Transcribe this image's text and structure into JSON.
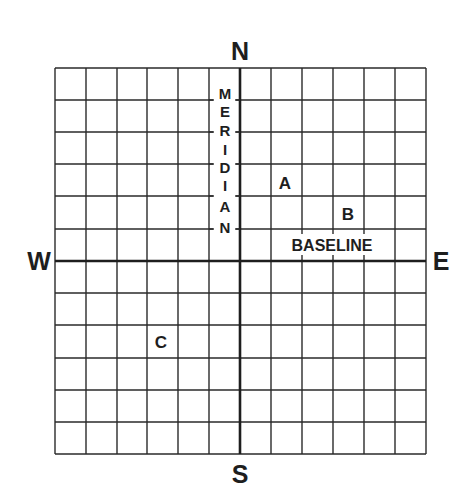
{
  "diagram": {
    "type": "survey-grid",
    "grid": {
      "columns": 12,
      "rows": 12,
      "left": 55,
      "top": 68,
      "cell_width": 31,
      "cell_height": 32.17,
      "line_color": "#2a2a2a",
      "axis_line_color": "#1e1e1e"
    },
    "compass": {
      "north": "N",
      "south": "S",
      "east": "E",
      "west": "W"
    },
    "axes": {
      "meridian_label": "MERIDIAN",
      "meridian_letters": [
        "M",
        "E",
        "R",
        "I",
        "D",
        "I",
        "A",
        "N"
      ],
      "baseline_label": "BASELINE"
    },
    "points": [
      {
        "label": "A",
        "x": 285,
        "y": 183
      },
      {
        "label": "B",
        "x": 348,
        "y": 214
      },
      {
        "label": "C",
        "x": 161,
        "y": 342
      }
    ]
  }
}
